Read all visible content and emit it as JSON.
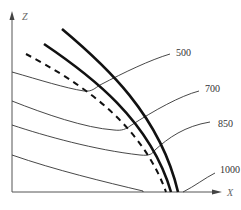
{
  "diagram": {
    "type": "cross-section schematic",
    "axes": {
      "x_label": "X",
      "z_label": "Z"
    },
    "isobars": [
      {
        "label": "500"
      },
      {
        "label": "700"
      },
      {
        "label": "850"
      },
      {
        "label": "1000"
      }
    ],
    "curves": [
      {
        "name": "outer-thick-curve",
        "style": "solid-thick"
      },
      {
        "name": "inner-thick-curve",
        "style": "solid-thick"
      },
      {
        "name": "dashed-curve",
        "style": "dashed-thick"
      }
    ],
    "colors": {
      "line": "#111111",
      "thin_line": "#333333",
      "axis": "#555555"
    }
  }
}
